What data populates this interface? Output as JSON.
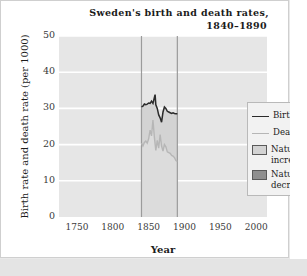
{
  "chart_data": {
    "type": "line",
    "title": "Sweden's birth and death rates,",
    "subtitle": "1840–1890",
    "xlabel": "Year",
    "ylabel": "Birth rate and death rate (per 1000)",
    "xlim": [
      1725,
      2015
    ],
    "ylim": [
      0,
      50
    ],
    "xticks": [
      1750,
      1800,
      1850,
      1900,
      1950,
      2000
    ],
    "yticks": [
      0,
      10,
      20,
      30,
      40,
      50
    ],
    "grid": true,
    "grid_color": "#ffffff",
    "plot_background": "#e6e6e6",
    "legend_position": "upper right",
    "data_range_markers": [
      1840,
      1890
    ],
    "legend": [
      {
        "label": "Birth rate",
        "type": "line",
        "color": "#2b2b2b"
      },
      {
        "label": "Death rate",
        "type": "line",
        "color": "#b6b6b6"
      },
      {
        "label": "Natural\nincrease",
        "type": "area",
        "color": "#d3d3d3"
      },
      {
        "label": "Natural\ndecrease",
        "type": "area",
        "color": "#8f8f8f"
      }
    ],
    "x": [
      1840,
      1842,
      1844,
      1846,
      1848,
      1850,
      1852,
      1854,
      1856,
      1858,
      1859,
      1860,
      1862,
      1864,
      1866,
      1868,
      1870,
      1872,
      1874,
      1876,
      1878,
      1880,
      1882,
      1884,
      1886,
      1888,
      1890
    ],
    "series": [
      {
        "name": "Birth rate",
        "color": "#2b2b2b",
        "values": [
          30.4,
          30.6,
          31.2,
          31.0,
          31.2,
          31.5,
          31.4,
          32.0,
          31.4,
          33.0,
          33.8,
          31.0,
          30.0,
          28.2,
          27.4,
          26.2,
          29.0,
          30.4,
          30.0,
          29.2,
          29.0,
          28.8,
          28.6,
          28.8,
          28.6,
          28.5,
          28.5
        ]
      },
      {
        "name": "Death rate",
        "color": "#b6b6b6",
        "values": [
          20.4,
          19.6,
          20.6,
          21.0,
          20.4,
          21.6,
          24.0,
          22.4,
          26.8,
          22.0,
          20.2,
          18.4,
          21.2,
          19.0,
          22.8,
          19.6,
          18.2,
          20.0,
          19.4,
          18.0,
          17.8,
          17.6,
          17.0,
          16.8,
          16.4,
          15.6,
          15.4
        ]
      }
    ]
  },
  "frame": {
    "card_border_color": "#cfcfcf",
    "page_background": "#e9e9e9"
  }
}
